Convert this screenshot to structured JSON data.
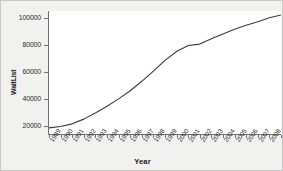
{
  "chart_data": {
    "type": "line",
    "title": "",
    "xlabel": "Year",
    "ylabel": "WaitList",
    "xlim": [
      1989,
      2009
    ],
    "ylim": [
      14000,
      105000
    ],
    "grid": false,
    "legend": false,
    "xticklabels": [
      "1989",
      "1990",
      "1991",
      "1992",
      "1993",
      "1994",
      "1995",
      "1996",
      "1997",
      "1998",
      "1999",
      "2000",
      "2001",
      "2002",
      "2003",
      "2004",
      "2005",
      "2006",
      "2007",
      "2008",
      "2009"
    ],
    "yticks": [
      20000,
      40000,
      60000,
      80000,
      100000
    ],
    "yticklabels": [
      "20000",
      "40000",
      "60000",
      "80000",
      "100000"
    ],
    "x": [
      1989,
      1990,
      1991,
      1992,
      1993,
      1994,
      1995,
      1996,
      1997,
      1998,
      1999,
      2000,
      2001,
      2002,
      2003,
      2004,
      2005,
      2006,
      2007,
      2008,
      2009
    ],
    "series": [
      {
        "name": "WaitList",
        "color": "#3a3a3a",
        "values": [
          18500,
          19500,
          21500,
          25000,
          29500,
          34500,
          40000,
          46000,
          53000,
          60500,
          68500,
          75000,
          79500,
          80500,
          84500,
          88000,
          91500,
          94500,
          97000,
          100000,
          102000
        ]
      }
    ]
  },
  "style": {
    "figure_background": "#f1f1f0",
    "panel_background": "#ffffff",
    "axis_color": "#707070",
    "line_color": "#3a3a3a",
    "tick_text_color": "#2b2b2b"
  }
}
